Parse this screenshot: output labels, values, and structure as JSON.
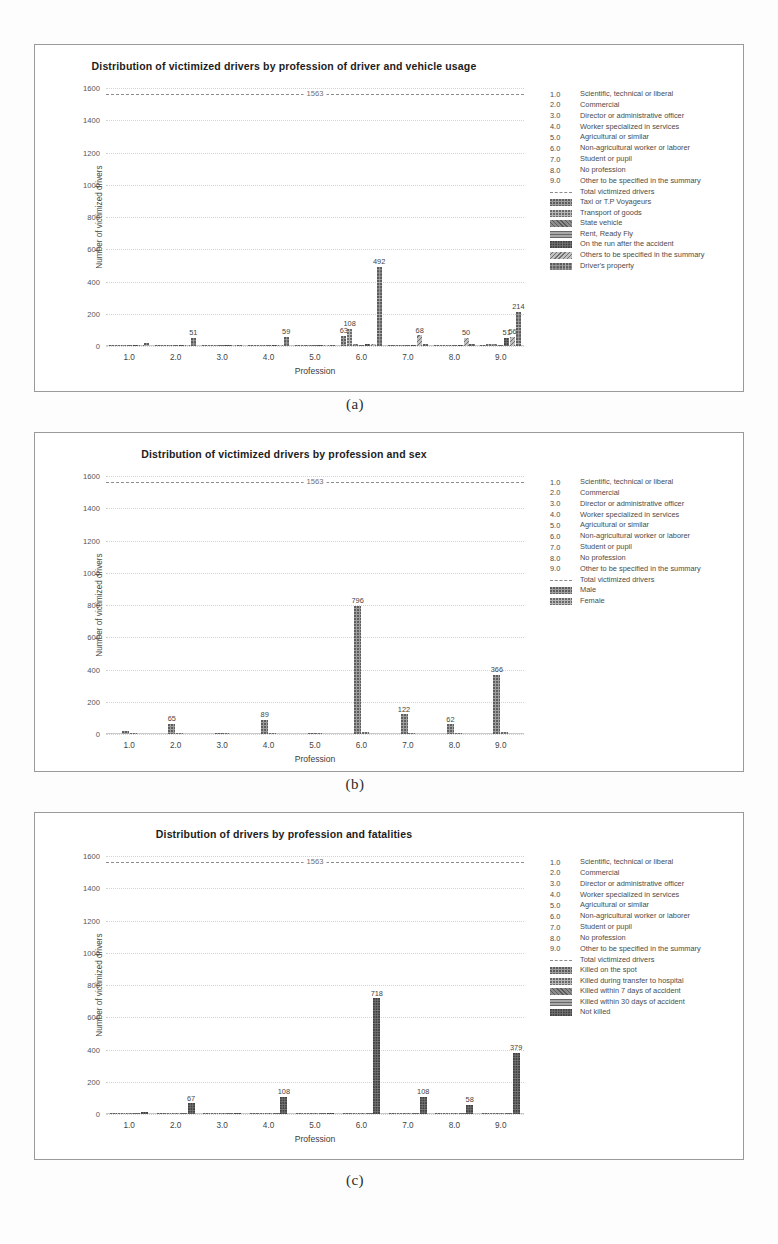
{
  "professions": [
    {
      "key": "1.0",
      "label": "Scientific, technical or liberal"
    },
    {
      "key": "2.0",
      "label": "Commercial"
    },
    {
      "key": "3.0",
      "label": "Director or administrative officer"
    },
    {
      "key": "4.0",
      "label": "Worker specialized in services"
    },
    {
      "key": "5.0",
      "label": "Agricultural or similar"
    },
    {
      "key": "6.0",
      "label": "Non-agricultural worker or laborer"
    },
    {
      "key": "7.0",
      "label": "Student or pupil"
    },
    {
      "key": "8.0",
      "label": "No profession"
    },
    {
      "key": "9.0",
      "label": "Other to be specified in the summary"
    }
  ],
  "total_legend_label": "Total victimized drivers",
  "axis": {
    "ylabel": "Number of victimized drivers",
    "xlabel": "Profession",
    "yticks": [
      "0",
      "200",
      "400",
      "600",
      "800",
      "1000",
      "1200",
      "1400",
      "1600"
    ],
    "ymax": 1600
  },
  "captions": {
    "a": "(a)",
    "b": "(b)",
    "c": "(c)"
  },
  "chart_data": [
    {
      "id": "a",
      "type": "bar",
      "title": "Distribution of victimized drivers by profession of driver and vehicle usage",
      "xlabel": "Profession",
      "ylabel": "Number of victimized drivers",
      "categories": [
        "1.0",
        "2.0",
        "3.0",
        "4.0",
        "5.0",
        "6.0",
        "7.0",
        "8.0",
        "9.0"
      ],
      "ylim": [
        0,
        1600
      ],
      "grid": true,
      "legend_position": "right",
      "total_line": {
        "label": "1563",
        "value": 1563
      },
      "series": [
        {
          "name": "Taxi or T.P Voyageurs",
          "values": [
            2,
            3,
            1,
            4,
            2,
            63,
            2,
            3,
            9
          ]
        },
        {
          "name": "Transport of goods",
          "values": [
            3,
            5,
            3,
            6,
            4,
            108,
            6,
            5,
            14
          ]
        },
        {
          "name": "State vehicle",
          "values": [
            4,
            6,
            4,
            7,
            5,
            12,
            7,
            6,
            11
          ]
        },
        {
          "name": "Rent, Ready  Fly",
          "values": [
            2,
            4,
            2,
            5,
            3,
            8,
            4,
            4,
            8
          ]
        },
        {
          "name": "On the run after the accident",
          "values": [
            3,
            5,
            3,
            6,
            4,
            10,
            5,
            5,
            51
          ]
        },
        {
          "name": "Others to be specified in the summary",
          "values": [
            5,
            8,
            6,
            9,
            7,
            14,
            68,
            50,
            56
          ]
        },
        {
          "name": "Driver's property",
          "values": [
            16,
            51,
            9,
            59,
            8,
            492,
            12,
            11,
            214
          ]
        }
      ],
      "data_labels": [
        {
          "group": "2.0",
          "text": "51"
        },
        {
          "group": "4.0",
          "text": "59"
        },
        {
          "group": "6.0",
          "text": "63"
        },
        {
          "group": "6.0",
          "text": "108"
        },
        {
          "group": "6.0",
          "text": "492"
        },
        {
          "group": "7.0",
          "text": "68"
        },
        {
          "group": "8.0",
          "text": "50"
        },
        {
          "group": "9.0",
          "text": "51"
        },
        {
          "group": "9.0",
          "text": "56"
        },
        {
          "group": "9.0",
          "text": "214"
        }
      ]
    },
    {
      "id": "b",
      "type": "bar",
      "title": "Distribution of victimized drivers by profession and sex",
      "xlabel": "Profession",
      "ylabel": "Number of victimized drivers",
      "categories": [
        "1.0",
        "2.0",
        "3.0",
        "4.0",
        "5.0",
        "6.0",
        "7.0",
        "8.0",
        "9.0"
      ],
      "ylim": [
        0,
        1600
      ],
      "grid": true,
      "legend_position": "right",
      "total_line": {
        "label": "1563",
        "value": 1563
      },
      "series": [
        {
          "name": "Male",
          "values": [
            16,
            65,
            9,
            89,
            7,
            796,
            122,
            62,
            366
          ]
        },
        {
          "name": "Female",
          "values": [
            2,
            4,
            2,
            6,
            1,
            10,
            6,
            5,
            13
          ]
        }
      ],
      "data_labels": [
        {
          "group": "1.0",
          "text": "16"
        },
        {
          "group": "2.0",
          "text": "65"
        },
        {
          "group": "3.0",
          "text": "9"
        },
        {
          "group": "4.0",
          "text": "89"
        },
        {
          "group": "5.0",
          "text": "7"
        },
        {
          "group": "6.0",
          "text": "796"
        },
        {
          "group": "7.0",
          "text": "122"
        },
        {
          "group": "8.0",
          "text": "62"
        },
        {
          "group": "9.0",
          "text": "366"
        }
      ]
    },
    {
      "id": "c",
      "type": "bar",
      "title": "Distribution of drivers by profession and fatalities",
      "xlabel": "Profession",
      "ylabel": "Number of victimized drivers",
      "categories": [
        "1.0",
        "2.0",
        "3.0",
        "4.0",
        "5.0",
        "6.0",
        "7.0",
        "8.0",
        "9.0"
      ],
      "ylim": [
        0,
        1600
      ],
      "grid": true,
      "legend_position": "right",
      "total_line": {
        "label": "1563",
        "value": 1563
      },
      "series": [
        {
          "name": "Killed on the spot",
          "values": [
            2,
            4,
            2,
            5,
            2,
            9,
            4,
            3,
            7
          ]
        },
        {
          "name": "Killed during transfer to hospital",
          "values": [
            2,
            3,
            1,
            4,
            1,
            7,
            3,
            2,
            5
          ]
        },
        {
          "name": "Killed within 7 days of accident",
          "values": [
            3,
            5,
            2,
            6,
            2,
            9,
            5,
            3,
            8
          ]
        },
        {
          "name": "Killed within 30 days of accident",
          "values": [
            2,
            4,
            2,
            5,
            2,
            8,
            4,
            3,
            6
          ]
        },
        {
          "name": "Not killed",
          "values": [
            14,
            67,
            8,
            108,
            7,
            718,
            108,
            58,
            379
          ]
        }
      ],
      "data_labels": [
        {
          "group": "2.0",
          "text": "67"
        },
        {
          "group": "4.0",
          "text": "108"
        },
        {
          "group": "6.0",
          "text": "718"
        },
        {
          "group": "7.0",
          "text": "108"
        },
        {
          "group": "8.0",
          "text": "58"
        },
        {
          "group": "9.0",
          "text": "379"
        }
      ]
    }
  ]
}
